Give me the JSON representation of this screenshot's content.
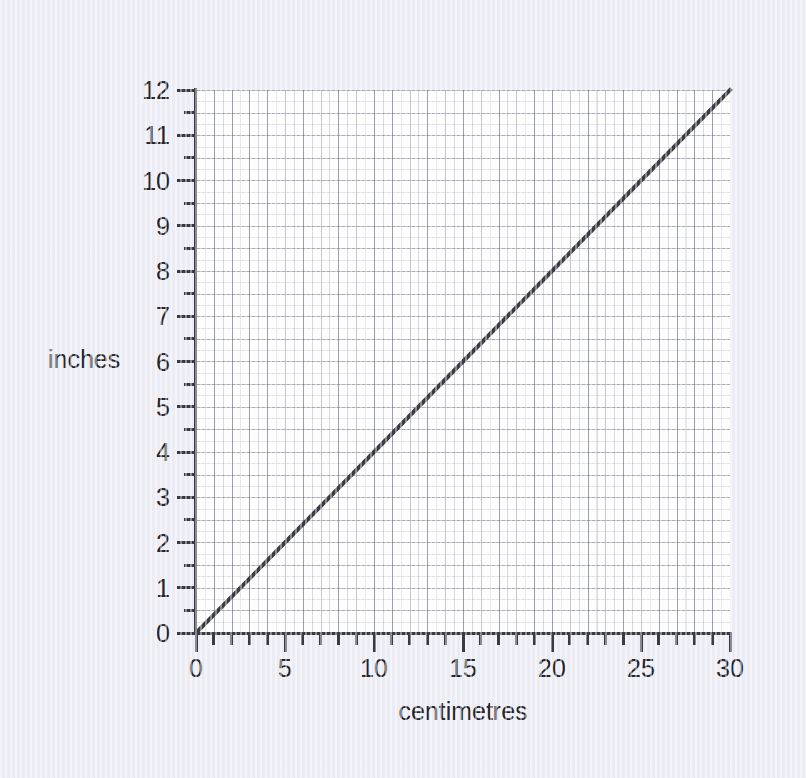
{
  "figure": {
    "background_color": "#ecedf4",
    "plot_background_color": "#fdfdfe",
    "axis_color": "#3a3a42",
    "line_color": "#3a3a42",
    "grid_color": "#787d96"
  },
  "axes": {
    "y_title": "inches",
    "x_title": "centimetres",
    "y_tick_labels": [
      "0",
      "1",
      "2",
      "3",
      "4",
      "5",
      "6",
      "7",
      "8",
      "9",
      "10",
      "11",
      "12"
    ],
    "x_tick_labels": [
      "0",
      "5",
      "10",
      "15",
      "20",
      "25",
      "30"
    ]
  },
  "chart_data": {
    "type": "line",
    "title": "",
    "subtitle": "",
    "xlabel": "centimetres",
    "ylabel": "inches",
    "xlim": [
      0,
      30
    ],
    "ylim": [
      0,
      12
    ],
    "x_major_tick_interval": 5,
    "x_minor_tick_interval": 1,
    "y_major_tick_interval": 1,
    "y_minor_tick_interval": 0.5,
    "x_major_gridline_interval": 1,
    "x_minor_gridline_interval": 0.5,
    "y_major_gridline_interval": 0.5,
    "y_minor_gridline_interval": 0.25,
    "grid": true,
    "legend": false,
    "legend_position": "none",
    "annotations": [],
    "series": [
      {
        "name": "centimetres to inches conversion",
        "color": "#3a3a42",
        "line_width": 3,
        "x": [
          0,
          5,
          10,
          15,
          20,
          25,
          30
        ],
        "y": [
          0,
          2,
          4,
          6,
          8,
          10,
          12
        ],
        "slope_inches_per_cm": 0.4,
        "intercept": 0
      }
    ]
  }
}
